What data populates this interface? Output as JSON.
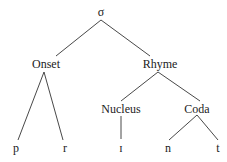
{
  "tree": {
    "root": {
      "label": "σ",
      "x": 101,
      "y": 7
    },
    "onset": {
      "label": "Onset",
      "x": 46,
      "y": 57
    },
    "rhyme": {
      "label": "Rhyme",
      "x": 160,
      "y": 57
    },
    "nucleus": {
      "label": "Nucleus",
      "x": 121,
      "y": 102
    },
    "coda": {
      "label": "Coda",
      "x": 197,
      "y": 102
    },
    "leaves": [
      {
        "label": "p",
        "x": 17,
        "y": 140
      },
      {
        "label": "r",
        "x": 65,
        "y": 140
      },
      {
        "label": "ɪ",
        "x": 121,
        "y": 140
      },
      {
        "label": "n",
        "x": 168,
        "y": 140
      },
      {
        "label": "t",
        "x": 218,
        "y": 140
      }
    ]
  }
}
